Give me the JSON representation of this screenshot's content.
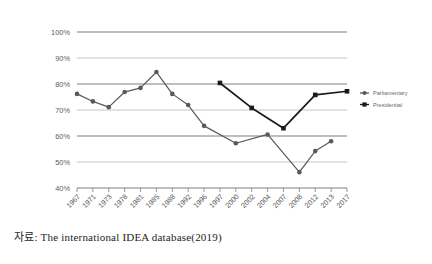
{
  "caption": "자료: The international IDEA database(2019)",
  "chart_data": {
    "type": "line",
    "title": "",
    "xlabel": "",
    "ylabel": "",
    "ylim": [
      40,
      100
    ],
    "ytick_labels": [
      "100%",
      "90%",
      "80%",
      "70%",
      "60%",
      "50%",
      "40%"
    ],
    "ytick_values": [
      100,
      90,
      80,
      70,
      60,
      50,
      40
    ],
    "grid": "horizontal",
    "legend_position": "right",
    "categories": [
      "1967",
      "1971",
      "1973",
      "1978",
      "1981",
      "1985",
      "1988",
      "1992",
      "1996",
      "1997",
      "2000",
      "2002",
      "2004",
      "2007",
      "2008",
      "2012",
      "2013",
      "2017"
    ],
    "series": [
      {
        "name": "Parliamentary",
        "color": "#595959",
        "marker": "circle",
        "points": [
          {
            "x": "1967",
            "y": 76.2
          },
          {
            "x": "1971",
            "y": 73.3
          },
          {
            "x": "1973",
            "y": 71.1
          },
          {
            "x": "1978",
            "y": 76.9
          },
          {
            "x": "1981",
            "y": 78.5
          },
          {
            "x": "1985",
            "y": 84.6
          },
          {
            "x": "1988",
            "y": 76.2
          },
          {
            "x": "1992",
            "y": 71.9
          },
          {
            "x": "1996",
            "y": 63.9
          },
          {
            "x": "2000",
            "y": 57.2
          },
          {
            "x": "2004",
            "y": 60.6
          },
          {
            "x": "2008",
            "y": 46.1
          },
          {
            "x": "2012",
            "y": 54.2
          },
          {
            "x": "2013",
            "y": 58.0
          }
        ]
      },
      {
        "name": "Presidential",
        "color": "#1a1a1a",
        "marker": "square",
        "points": [
          {
            "x": "1997",
            "y": 80.4
          },
          {
            "x": "2002",
            "y": 70.8
          },
          {
            "x": "2007",
            "y": 63.0
          },
          {
            "x": "2012",
            "y": 75.8
          },
          {
            "x": "2017",
            "y": 77.2
          }
        ]
      }
    ]
  }
}
